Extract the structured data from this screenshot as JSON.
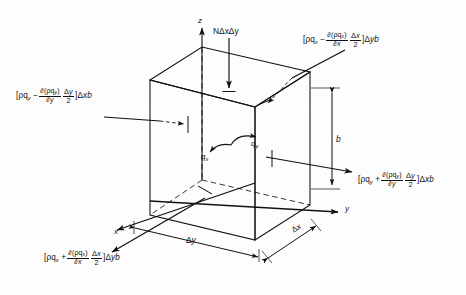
{
  "figure": {
    "type": "control-volume-diagram",
    "background_color": "#fdfdfd",
    "line_color": "#101010"
  },
  "axes": {
    "z_label": "z",
    "x_label": "x",
    "y_label": "y"
  },
  "source_term": {
    "label_text": "NΔxΔy",
    "N": "N",
    "dx": "Δx",
    "dy": "Δy"
  },
  "flow_vectors": {
    "qx": {
      "base": "q",
      "sub": "x"
    },
    "qy": {
      "base": "q",
      "sub": "y"
    }
  },
  "dimensions": {
    "delta_y": {
      "delta": "Δ",
      "var": "y"
    },
    "delta_x": {
      "delta": "Δ",
      "var": "x"
    },
    "thickness": "b"
  },
  "flux_labels": {
    "x_in": {
      "position": "top-right",
      "open_bracket": "[",
      "term1_rho": "ρq",
      "term1_sub": "x",
      "operator": "−",
      "frac_num_prefix": "∂(",
      "frac_num_rho": "ρq",
      "frac_num_sub": "x",
      "frac_num_suffix": ")",
      "frac_den_prefix": "∂",
      "frac_den_var": "x",
      "half_num_delta": "Δ",
      "half_num_var": "x",
      "half_den": "2",
      "close_bracket": "]",
      "area_delta": "Δ",
      "area_var": "y",
      "area_b": "b"
    },
    "x_out": {
      "position": "bottom-left",
      "open_bracket": "[",
      "term1_rho": "ρq",
      "term1_sub": "x",
      "operator": "+",
      "frac_num_prefix": "∂(",
      "frac_num_rho": "ρq",
      "frac_num_sub": "x",
      "frac_num_suffix": ")",
      "frac_den_prefix": "∂",
      "frac_den_var": "x",
      "half_num_delta": "Δ",
      "half_num_var": "x",
      "half_den": "2",
      "close_bracket": "]",
      "area_delta": "Δ",
      "area_var": "y",
      "area_b": "b"
    },
    "y_in": {
      "position": "left",
      "open_bracket": "[",
      "term1_rho": "ρq",
      "term1_sub": "y",
      "operator": "−",
      "frac_num_prefix": "∂(",
      "frac_num_rho": "ρq",
      "frac_num_sub": "y",
      "frac_num_suffix": ")",
      "frac_den_prefix": "∂",
      "frac_den_var": "y",
      "half_num_delta": "Δ",
      "half_num_var": "y",
      "half_den": "2",
      "close_bracket": "]",
      "area_delta": "Δ",
      "area_var": "x",
      "area_b": "b"
    },
    "y_out": {
      "position": "right",
      "open_bracket": "[",
      "term1_rho": "ρq",
      "term1_sub": "y",
      "operator": "+",
      "frac_num_prefix": "∂(",
      "frac_num_rho": "ρq",
      "frac_num_sub": "y",
      "frac_num_suffix": ")",
      "frac_den_prefix": "∂",
      "frac_den_var": "y",
      "half_num_delta": "Δ",
      "half_num_var": "y",
      "half_den": "2",
      "close_bracket": "]",
      "area_delta": "Δ",
      "area_var": "x",
      "area_b": "b"
    }
  }
}
